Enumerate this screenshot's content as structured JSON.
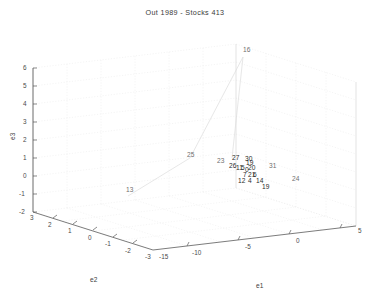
{
  "title": "Out 1989 - Stocks  413",
  "axes": {
    "x": {
      "label": "e1",
      "ticks": [
        "-15",
        "-10",
        "-5",
        "0",
        "5"
      ],
      "range": [
        -15,
        5
      ]
    },
    "y": {
      "label": "e2",
      "ticks": [
        "3",
        "2",
        "1",
        "0",
        "-1",
        "-2",
        "-3"
      ],
      "range": [
        -3,
        3
      ]
    },
    "z": {
      "label": "e3",
      "ticks": [
        "6",
        "5",
        "4",
        "3",
        "2",
        "1",
        "0",
        "-1",
        "-2"
      ],
      "range": [
        -2,
        6
      ]
    }
  },
  "chart_data": {
    "type": "scatter",
    "title": "Out 1989 - Stocks  413",
    "xlabel": "e1",
    "ylabel": "e2",
    "zlabel": "e3",
    "xlim": [
      -15,
      5
    ],
    "ylim": [
      -3,
      3
    ],
    "zlim": [
      -2,
      6
    ],
    "grid": true,
    "legend": "none",
    "projection": "3d",
    "marker": "text-label",
    "note": "Each point is drawn as its numeric stock index label at its (e1,e2,e3) position; a faint polyline connects the outlying points to the central cluster.",
    "points": [
      {
        "label": "16",
        "px": 243,
        "py": 47,
        "e1": -5.0,
        "e2": 0.6,
        "e3": 5.6
      },
      {
        "label": "25",
        "px": 187,
        "py": 152,
        "e1": -9.6,
        "e2": 0.1,
        "e3": 0.9
      },
      {
        "label": "13",
        "px": 126,
        "py": 187,
        "e1": -12.7,
        "e2": 1.5,
        "e3": -0.9
      },
      {
        "label": "23",
        "px": 217,
        "py": 158,
        "e1": -7.4,
        "e2": -0.2,
        "e3": 0.3
      },
      {
        "label": "27",
        "px": 232,
        "py": 155,
        "e1": -6.6,
        "e2": -0.3,
        "e3": 0.4
      },
      {
        "label": "30",
        "px": 245,
        "py": 156,
        "e1": -6.1,
        "e2": -0.4,
        "e3": 0.3
      },
      {
        "label": "19",
        "px": 246,
        "py": 160,
        "e1": -6.0,
        "e2": -0.4,
        "e3": 0.1
      },
      {
        "label": "26",
        "px": 229,
        "py": 163,
        "e1": -6.5,
        "e2": -0.3,
        "e3": 0.0
      },
      {
        "label": "11",
        "px": 236,
        "py": 165,
        "e1": -6.3,
        "e2": -0.4,
        "e3": -0.1
      },
      {
        "label": "5",
        "px": 241,
        "py": 165,
        "e1": -6.1,
        "e2": -0.4,
        "e3": -0.1
      },
      {
        "label": "20",
        "px": 248,
        "py": 165,
        "e1": -5.8,
        "e2": -0.5,
        "e3": -0.1
      },
      {
        "label": "0",
        "px": 245,
        "py": 167,
        "e1": -5.9,
        "e2": -0.5,
        "e3": -0.2
      },
      {
        "label": "31",
        "px": 269,
        "py": 163,
        "e1": -4.6,
        "e2": -0.7,
        "e3": 0.0
      },
      {
        "label": "7",
        "px": 243,
        "py": 172,
        "e1": -6.0,
        "e2": -0.5,
        "e3": -0.4
      },
      {
        "label": "21",
        "px": 248,
        "py": 172,
        "e1": -5.8,
        "e2": -0.5,
        "e3": -0.4
      },
      {
        "label": "6",
        "px": 253,
        "py": 172,
        "e1": -5.6,
        "e2": -0.6,
        "e3": -0.4
      },
      {
        "label": "12",
        "px": 238,
        "py": 178,
        "e1": -6.2,
        "e2": -0.5,
        "e3": -0.6
      },
      {
        "label": "4",
        "px": 248,
        "py": 178,
        "e1": -5.8,
        "e2": -0.6,
        "e3": -0.6
      },
      {
        "label": "14",
        "px": 256,
        "py": 178,
        "e1": -5.4,
        "e2": -0.6,
        "e3": -0.6
      },
      {
        "label": "19",
        "px": 262,
        "py": 184,
        "e1": -5.1,
        "e2": -0.7,
        "e3": -0.8
      },
      {
        "label": "24",
        "px": 292,
        "py": 176,
        "e1": -3.4,
        "e2": -1.1,
        "e3": -0.5
      }
    ],
    "trajectory": [
      "13",
      "25",
      "16",
      "23"
    ]
  },
  "colors": {
    "background": "#ffffff",
    "axis": "#555555",
    "grid": "#e4e4e4",
    "text": "#3a3a3a",
    "point_label": "#2b2b2b",
    "trajectory": "#d8d8d8"
  }
}
